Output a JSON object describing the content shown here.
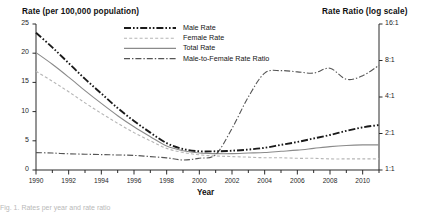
{
  "figure": {
    "left_axis_title": "Rate (per 100,000 population)",
    "right_axis_title": "Rate Ratio (log scale)",
    "x_axis_title": "Year",
    "caption_fragment": "Fig. 1. Rates per year and rate ratio"
  },
  "legend": {
    "items": [
      {
        "label": "Male Rate",
        "style": "dash-dot-dot",
        "color": "#1a1a1a",
        "width": 1.9
      },
      {
        "label": "Female Rate",
        "style": "dashed",
        "color": "#b5b5b5",
        "width": 1.1
      },
      {
        "label": "Total Rate",
        "style": "solid",
        "color": "#8a8a8a",
        "width": 1.1
      },
      {
        "label": "Male-to-Female Rate Ratio",
        "style": "dash-dot",
        "color": "#555555",
        "width": 1.1
      }
    ]
  },
  "chart_data": {
    "type": "line",
    "title": "",
    "xlabel": "Year",
    "ylabel": "Rate (per 100,000 population)",
    "y2label": "Rate Ratio (log scale)",
    "grid": false,
    "legend_position": "top-center",
    "xlim": [
      1990,
      2011
    ],
    "ylim": [
      0,
      25
    ],
    "y2lim": [
      1,
      16
    ],
    "y2_scale": "log2",
    "x": [
      1990,
      1991,
      1992,
      1993,
      1994,
      1995,
      1996,
      1997,
      1998,
      1999,
      2000,
      2001,
      2002,
      2003,
      2004,
      2005,
      2006,
      2007,
      2008,
      2009,
      2010,
      2011
    ],
    "xticks_major": [
      1990,
      1992,
      1994,
      1996,
      1998,
      2000,
      2002,
      2004,
      2006,
      2008,
      2010
    ],
    "xticks_minor": [
      1991,
      1993,
      1995,
      1997,
      1999,
      2001,
      2003,
      2005,
      2007,
      2009,
      2011
    ],
    "yticks_left": [
      0,
      5,
      10,
      15,
      20,
      25
    ],
    "yticks_right": [
      "1:1",
      "2:1",
      "4:1",
      "8:1",
      "16:1"
    ],
    "yticks_right_values": [
      1,
      2,
      4,
      8,
      16
    ],
    "series": [
      {
        "name": "Male Rate",
        "axis": "left",
        "values": [
          23.5,
          21.0,
          18.3,
          15.6,
          13.1,
          10.6,
          8.4,
          6.4,
          4.6,
          3.6,
          3.2,
          3.2,
          3.3,
          3.5,
          3.8,
          4.3,
          4.8,
          5.4,
          6.0,
          6.7,
          7.3,
          7.7
        ]
      },
      {
        "name": "Female Rate",
        "axis": "left",
        "values": [
          16.9,
          15.2,
          13.4,
          11.5,
          9.7,
          8.0,
          6.4,
          5.0,
          3.7,
          3.0,
          2.6,
          2.4,
          2.3,
          2.2,
          2.1,
          2.1,
          2.0,
          2.0,
          1.9,
          1.9,
          1.9,
          1.9
        ]
      },
      {
        "name": "Total Rate",
        "axis": "left",
        "values": [
          20.1,
          18.1,
          15.9,
          13.6,
          11.4,
          9.3,
          7.4,
          5.7,
          4.1,
          3.3,
          2.9,
          2.8,
          2.8,
          2.9,
          3.0,
          3.2,
          3.4,
          3.7,
          4.0,
          4.2,
          4.3,
          4.3
        ]
      },
      {
        "name": "Male-to-Female Rate Ratio",
        "axis": "right",
        "values": [
          1.39,
          1.38,
          1.36,
          1.35,
          1.34,
          1.33,
          1.32,
          1.29,
          1.26,
          1.21,
          1.25,
          1.34,
          2.2,
          4.0,
          6.3,
          6.6,
          6.45,
          6.3,
          6.9,
          5.6,
          6.0,
          7.3
        ]
      }
    ]
  }
}
